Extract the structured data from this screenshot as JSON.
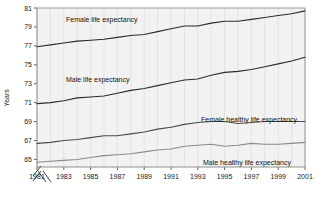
{
  "chart_data": {
    "type": "line",
    "title": "",
    "xlabel": "",
    "ylabel": "Years",
    "xlim": [
      1981,
      2001
    ],
    "ylim": [
      64.2,
      81
    ],
    "grid": "vertical-only",
    "legend_position": "inline-annotations",
    "axis_break_x": true,
    "axis_break_y": true,
    "xticks": [
      "1981",
      "1983",
      "1985",
      "1987",
      "1989",
      "1991",
      "1993",
      "1995",
      "1997",
      "1999",
      "2001"
    ],
    "yticks": [
      "65",
      "67",
      "69",
      "71",
      "73",
      "75",
      "77",
      "79",
      "81"
    ],
    "x": [
      1981,
      1982,
      1983,
      1984,
      1985,
      1986,
      1987,
      1988,
      1989,
      1990,
      1991,
      1992,
      1993,
      1994,
      1995,
      1996,
      1997,
      1998,
      1999,
      2000,
      2001
    ],
    "series": [
      {
        "name": "Female life expectancy",
        "color": "#2b2b2b",
        "values": [
          76.9,
          77.1,
          77.3,
          77.5,
          77.6,
          77.7,
          77.9,
          78.1,
          78.2,
          78.5,
          78.8,
          79.1,
          79.1,
          79.4,
          79.6,
          79.6,
          79.8,
          80.0,
          80.2,
          80.4,
          80.7
        ]
      },
      {
        "name": "Male life expectancy",
        "color": "#2b2b2b",
        "values": [
          70.9,
          71.0,
          71.2,
          71.5,
          71.6,
          71.7,
          72.0,
          72.3,
          72.5,
          72.8,
          73.1,
          73.4,
          73.5,
          73.9,
          74.2,
          74.3,
          74.5,
          74.8,
          75.1,
          75.4,
          75.8
        ]
      },
      {
        "name": "Female healthy life expectancy",
        "color": "#4a4a4a",
        "values": [
          66.7,
          66.8,
          67.0,
          67.1,
          67.3,
          67.5,
          67.5,
          67.7,
          67.9,
          68.2,
          68.4,
          68.7,
          68.9,
          69.0,
          69.0,
          68.8,
          68.9,
          69.0,
          69.0,
          69.0,
          69.0
        ]
      },
      {
        "name": "Male healthy life expectancy",
        "color": "#8a8a8a",
        "values": [
          64.7,
          64.8,
          64.9,
          65.0,
          65.2,
          65.4,
          65.5,
          65.6,
          65.8,
          66.0,
          66.1,
          66.4,
          66.5,
          66.6,
          66.4,
          66.5,
          66.7,
          66.6,
          66.6,
          66.7,
          66.8
        ]
      }
    ],
    "annotations": [
      {
        "name": "female-life-expectancy-label",
        "text": "Female life expectancy",
        "x": 66,
        "y": 22
      },
      {
        "name": "male-life-expectancy-label",
        "text": "Male life expectancy",
        "x": 66,
        "y": 82
      },
      {
        "name": "female-healthy-life-expectancy-label",
        "text": "Female healthy life expectancy",
        "x": 201,
        "y": 122
      },
      {
        "name": "male-healthy-life-expectancy-label",
        "text": "Male healthy life expectancy",
        "x": 203,
        "y": 165
      }
    ],
    "colors": {
      "plot_background": "#f2f2f2",
      "grid": "#dcdcdc",
      "frame": "#9a9a9a",
      "text": "#1a1a1a"
    }
  }
}
